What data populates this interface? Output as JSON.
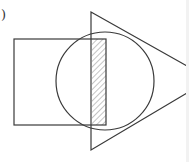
{
  "figure": {
    "label": ")",
    "shapes": [
      "square",
      "circle",
      "triangle"
    ],
    "shaded_region": "intersection of square, circle and triangle",
    "stroke_color": "#3a3a3a",
    "hatch_color": "#8a8a8a",
    "background_color": "#ffffff"
  }
}
